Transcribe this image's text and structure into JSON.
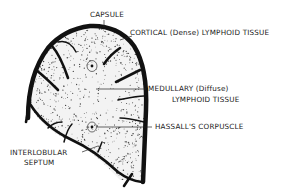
{
  "figure": {
    "colors": {
      "ink": "#111111",
      "background": "#ffffff",
      "stipple": "#444444"
    },
    "labels": {
      "capsule": "CAPSULE",
      "cortical": "CORTICAL (Dense) LYMPHOID TISSUE",
      "medullary_line1": "MEDULLARY (Diffuse)",
      "medullary_line2": "LYMPHOID TISSUE",
      "hassalls": "HASSALL'S CORPUSCLE",
      "interlobular_line1": "INTERLOBULAR",
      "interlobular_line2": "SEPTUM"
    }
  }
}
